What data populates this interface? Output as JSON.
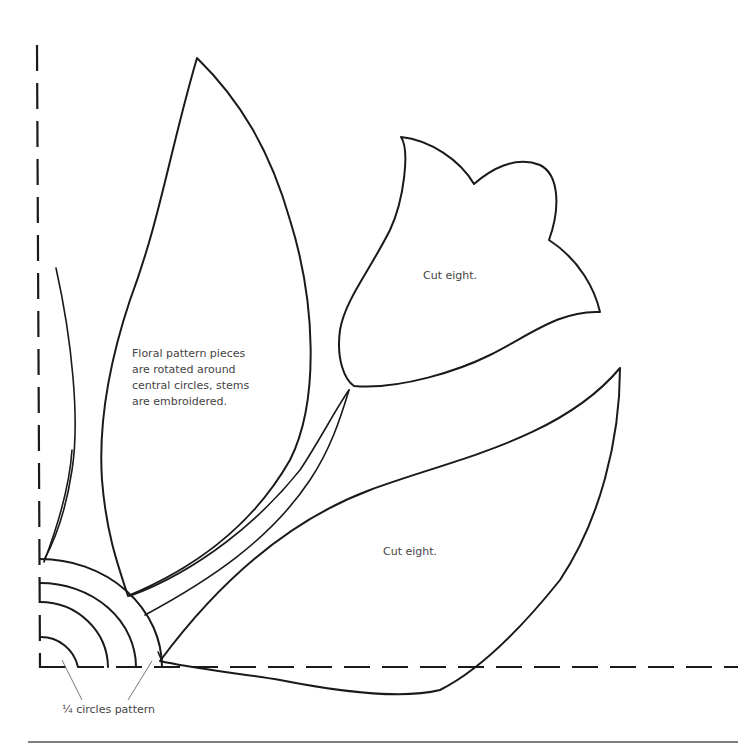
{
  "diagram": {
    "type": "quilt-applique-pattern",
    "pieces": [
      {
        "id": "tall-leaf",
        "label": "Floral pattern pieces\nare rotated around\ncentral circles, stems\nare embroidered."
      },
      {
        "id": "tulip-flower",
        "label": "Cut eight."
      },
      {
        "id": "wide-leaf",
        "label": "Cut eight."
      },
      {
        "id": "narrow-stem-leaf",
        "label": ""
      },
      {
        "id": "quarter-circles",
        "label": "¼ circles pattern"
      }
    ],
    "quarter_circle_count": 4,
    "fold_lines": [
      "left-vertical-dashed",
      "bottom-horizontal-dashed"
    ]
  },
  "labels": {
    "note": "Floral pattern pieces\nare rotated around\ncentral circles, stems\nare embroidered.",
    "tulip": "Cut eight.",
    "leaf": "Cut eight.",
    "circles": "¼ circles pattern"
  },
  "colors": {
    "line": "#1a1a1a",
    "text": "#444444",
    "leader": "#777777",
    "background": "#ffffff"
  }
}
